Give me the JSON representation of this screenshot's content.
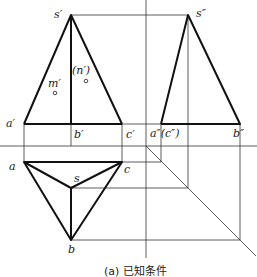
{
  "diagram": {
    "type": "orthographic-projection",
    "caption": "(a)  已知条件",
    "views": {
      "front": {
        "labels": {
          "apex": "s′",
          "a": "a′",
          "b": "b′",
          "c": "c′",
          "m": "m′",
          "n": "(n′)"
        }
      },
      "side": {
        "labels": {
          "apex": "s″",
          "a_c": "a″(c″)",
          "b": "b″"
        }
      },
      "top": {
        "labels": {
          "a": "a",
          "b": "b",
          "c": "c",
          "s": "s"
        }
      }
    },
    "colors": {
      "line": "#111111",
      "thin_line": "#333333",
      "background": "#ffffff"
    }
  }
}
